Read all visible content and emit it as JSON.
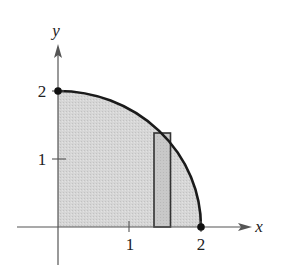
{
  "figure": {
    "type": "quarter-circle region with representative rectangle",
    "axes": {
      "x_label": "x",
      "y_label": "y",
      "x_ticks": [
        {
          "value": 1,
          "label": "1"
        },
        {
          "value": 2,
          "label": "2"
        }
      ],
      "y_ticks": [
        {
          "value": 1,
          "label": "1"
        },
        {
          "value": 2,
          "label": "2"
        }
      ]
    },
    "curve": {
      "description": "Quarter circle of radius 2 in the first quadrant",
      "from": [
        0,
        2
      ],
      "to": [
        2,
        0
      ]
    },
    "points": [
      {
        "name": "point-0-2",
        "x": 0,
        "y": 2
      },
      {
        "name": "point-2-0",
        "x": 2,
        "y": 0
      }
    ],
    "rectangle": {
      "x_left": 1.35,
      "x_right": 1.58,
      "height": 1.38
    },
    "colors": {
      "region_fill": "#d4d4d4",
      "rectangle_fill": "#c4c4c4",
      "curve": "#1a1a1a",
      "axis": "#555555"
    }
  }
}
